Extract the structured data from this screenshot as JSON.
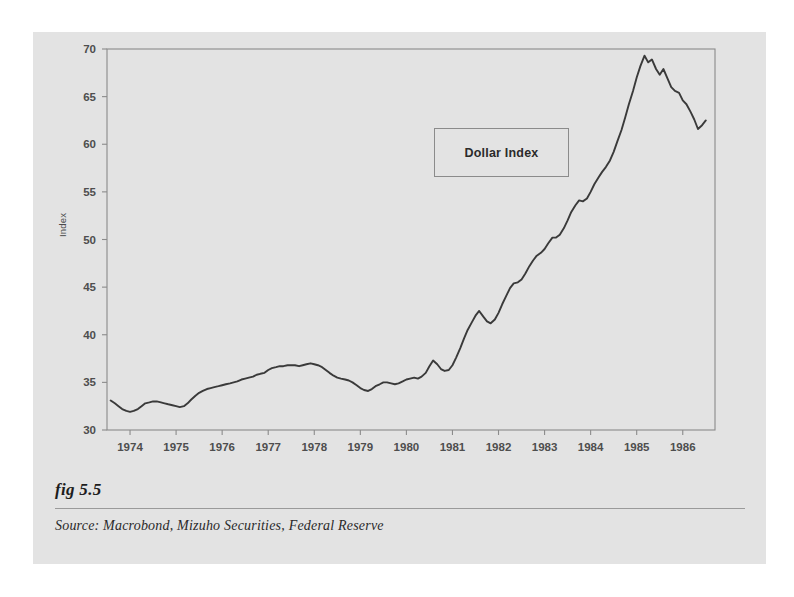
{
  "figure": {
    "number_label": "fig 5.5",
    "source_label": "Source:  Macrobond, Mizuho Securities, Federal Reserve",
    "panel_color": "#e3e3e3",
    "page_color": "#ffffff"
  },
  "legend": {
    "label": "Dollar Index",
    "position": "inside-upper-center"
  },
  "chart_data": {
    "type": "line",
    "title": "",
    "subtitle": "",
    "xlabel": "",
    "ylabel": "Index",
    "legend_entries": [
      "Dollar Index"
    ],
    "legend_position": "inside upper center",
    "grid": false,
    "line_color": "#3a3a3a",
    "frame_color": "#8b8b8b",
    "xlim": [
      1973.5,
      1986.7
    ],
    "ylim": [
      30,
      70
    ],
    "xticks": [
      1974,
      1975,
      1976,
      1977,
      1978,
      1979,
      1980,
      1981,
      1982,
      1983,
      1984,
      1985,
      1986
    ],
    "xtick_labels": [
      "1974",
      "1975",
      "1976",
      "1977",
      "1978",
      "1979",
      "1980",
      "1981",
      "1982",
      "1983",
      "1984",
      "1985",
      "1986"
    ],
    "yticks": [
      30,
      35,
      40,
      45,
      50,
      55,
      60,
      65,
      70
    ],
    "ytick_labels": [
      "30",
      "35",
      "40",
      "45",
      "50",
      "55",
      "60",
      "65",
      "70"
    ],
    "series": [
      {
        "name": "Dollar Index",
        "x": [
          1973.58,
          1973.67,
          1973.75,
          1973.83,
          1973.92,
          1974.0,
          1974.08,
          1974.17,
          1974.25,
          1974.33,
          1974.42,
          1974.5,
          1974.58,
          1974.67,
          1974.75,
          1974.83,
          1974.92,
          1975.0,
          1975.08,
          1975.17,
          1975.25,
          1975.33,
          1975.42,
          1975.5,
          1975.58,
          1975.67,
          1975.75,
          1975.83,
          1975.92,
          1976.0,
          1976.08,
          1976.17,
          1976.25,
          1976.33,
          1976.42,
          1976.5,
          1976.58,
          1976.67,
          1976.75,
          1976.83,
          1976.92,
          1977.0,
          1977.08,
          1977.17,
          1977.25,
          1977.33,
          1977.42,
          1977.5,
          1977.58,
          1977.67,
          1977.75,
          1977.83,
          1977.92,
          1978.0,
          1978.08,
          1978.17,
          1978.25,
          1978.33,
          1978.42,
          1978.5,
          1978.58,
          1978.67,
          1978.75,
          1978.83,
          1978.92,
          1979.0,
          1979.08,
          1979.17,
          1979.25,
          1979.33,
          1979.42,
          1979.5,
          1979.58,
          1979.67,
          1979.75,
          1979.83,
          1979.92,
          1980.0,
          1980.08,
          1980.17,
          1980.25,
          1980.33,
          1980.42,
          1980.5,
          1980.58,
          1980.67,
          1980.75,
          1980.83,
          1980.92,
          1981.0,
          1981.08,
          1981.17,
          1981.25,
          1981.33,
          1981.42,
          1981.5,
          1981.58,
          1981.67,
          1981.75,
          1981.83,
          1981.92,
          1982.0,
          1982.08,
          1982.17,
          1982.25,
          1982.33,
          1982.42,
          1982.5,
          1982.58,
          1982.67,
          1982.75,
          1982.83,
          1982.92,
          1983.0,
          1983.08,
          1983.17,
          1983.25,
          1983.33,
          1983.42,
          1983.5,
          1983.58,
          1983.67,
          1983.75,
          1983.83,
          1983.92,
          1984.0,
          1984.08,
          1984.17,
          1984.25,
          1984.33,
          1984.42,
          1984.5,
          1984.58,
          1984.67,
          1984.75,
          1984.83,
          1984.92,
          1985.0,
          1985.08,
          1985.17,
          1985.25,
          1985.33,
          1985.42,
          1985.5,
          1985.58,
          1985.67,
          1985.75,
          1985.83,
          1985.92,
          1986.0,
          1986.08,
          1986.17,
          1986.25,
          1986.33,
          1986.42,
          1986.5
        ],
        "y": [
          33.1,
          32.8,
          32.5,
          32.2,
          32.0,
          31.9,
          32.0,
          32.2,
          32.5,
          32.8,
          32.9,
          33.0,
          33.0,
          32.9,
          32.8,
          32.7,
          32.6,
          32.5,
          32.4,
          32.5,
          32.8,
          33.2,
          33.6,
          33.9,
          34.1,
          34.3,
          34.4,
          34.5,
          34.6,
          34.7,
          34.8,
          34.9,
          35.0,
          35.1,
          35.3,
          35.4,
          35.5,
          35.6,
          35.8,
          35.9,
          36.0,
          36.3,
          36.5,
          36.6,
          36.7,
          36.7,
          36.8,
          36.8,
          36.8,
          36.7,
          36.8,
          36.9,
          37.0,
          36.9,
          36.8,
          36.6,
          36.3,
          36.0,
          35.7,
          35.5,
          35.4,
          35.3,
          35.2,
          35.0,
          34.7,
          34.4,
          34.2,
          34.1,
          34.3,
          34.6,
          34.8,
          35.0,
          35.0,
          34.9,
          34.8,
          34.9,
          35.1,
          35.3,
          35.4,
          35.5,
          35.4,
          35.6,
          36.0,
          36.7,
          37.3,
          36.9,
          36.4,
          36.2,
          36.3,
          36.8,
          37.6,
          38.6,
          39.6,
          40.5,
          41.3,
          42.0,
          42.5,
          41.9,
          41.4,
          41.2,
          41.6,
          42.3,
          43.2,
          44.1,
          44.9,
          45.4,
          45.5,
          45.8,
          46.4,
          47.2,
          47.8,
          48.3,
          48.6,
          49.0,
          49.6,
          50.2,
          50.2,
          50.5,
          51.2,
          52.0,
          52.9,
          53.6,
          54.1,
          54.0,
          54.3,
          55.0,
          55.8,
          56.5,
          57.1,
          57.6,
          58.3,
          59.2,
          60.3,
          61.5,
          62.8,
          64.2,
          65.6,
          67.0,
          68.2,
          69.3,
          68.6,
          68.9,
          67.9,
          67.3,
          67.9,
          66.9,
          66.0,
          65.6,
          65.4,
          64.6,
          64.2,
          63.4,
          62.6,
          61.6,
          62.0,
          62.5
        ]
      }
    ],
    "annotations": {
      "peak_value": 69.3,
      "peak_year": 1985.17,
      "trough_value": 31.9,
      "trough_year": 1974.0,
      "start_value": 33.1,
      "end_value": 62.5
    }
  }
}
